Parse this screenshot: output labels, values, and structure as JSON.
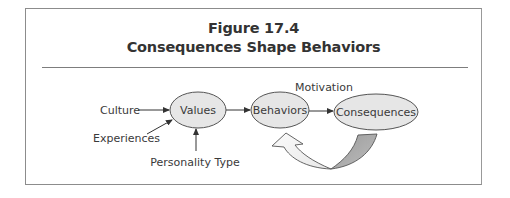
{
  "figure": {
    "number": "Figure 17.4",
    "title": "Consequences Shape Behaviors"
  },
  "nodes": [
    {
      "id": "values",
      "label": "Values",
      "cx": 198,
      "cy": 110,
      "rx": 28,
      "ry": 18
    },
    {
      "id": "behaviors",
      "label": "Behaviors",
      "cx": 280,
      "cy": 110,
      "rx": 29,
      "ry": 18
    },
    {
      "id": "consequences",
      "label": "Consequences",
      "cx": 376,
      "cy": 112,
      "rx": 42,
      "ry": 18
    }
  ],
  "inputs": [
    {
      "id": "culture",
      "label": "Culture",
      "target": "values"
    },
    {
      "id": "experiences",
      "label": "Experiences",
      "target": "values"
    },
    {
      "id": "personality-type",
      "label": "Personality Type",
      "target": "values"
    }
  ],
  "edge_labels": {
    "motivation": "Motivation"
  },
  "edges": [
    {
      "from": "culture",
      "to": "values"
    },
    {
      "from": "experiences",
      "to": "values"
    },
    {
      "from": "personality-type",
      "to": "values"
    },
    {
      "from": "values",
      "to": "behaviors"
    },
    {
      "from": "behaviors",
      "to": "consequences"
    },
    {
      "from": "consequences",
      "to": "behaviors",
      "style": "curved-feedback-arrow"
    }
  ],
  "colors": {
    "node_fill": "#e6e6e6",
    "node_stroke": "#555555",
    "feedback_dark": "#a6a6a6",
    "feedback_light": "#f4f4f4",
    "text": "#3a3a3a"
  }
}
